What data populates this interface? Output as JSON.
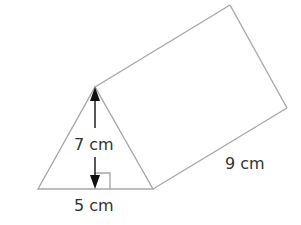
{
  "figure": {
    "type": "triangular prism",
    "labels": {
      "height": "7 cm",
      "base": "5 cm",
      "length": "9 cm"
    },
    "colors": {
      "edge": "#a8a8a8",
      "arrow": "#111111",
      "text": "#333333"
    }
  }
}
